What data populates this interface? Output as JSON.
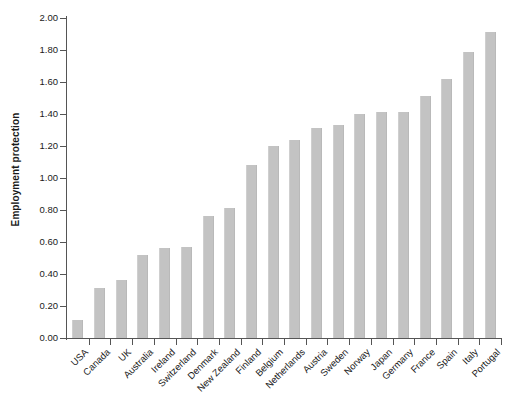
{
  "chart_data": {
    "type": "bar",
    "title": "",
    "xlabel": "",
    "ylabel": "Employment protection",
    "ylim": [
      0,
      2.0
    ],
    "ytick_step": 0.2,
    "grid": false,
    "legend": null,
    "bar_color": "#c3c3c3",
    "axis_color": "#555555",
    "categories": [
      "USA",
      "Canada",
      "UK",
      "Australia",
      "Ireland",
      "Switzerland",
      "Denmark",
      "New Zealand",
      "Finland",
      "Belgium",
      "Netherlands",
      "Austria",
      "Sweden",
      "Norway",
      "Japan",
      "Germany",
      "France",
      "Spain",
      "Italy",
      "Portugal"
    ],
    "values": [
      0.11,
      0.31,
      0.36,
      0.52,
      0.56,
      0.57,
      0.76,
      0.81,
      1.08,
      1.2,
      1.24,
      1.31,
      1.33,
      1.4,
      1.41,
      1.41,
      1.51,
      1.62,
      1.79,
      1.91
    ],
    "ytick_labels": [
      "0.00",
      "0.20",
      "0.40",
      "0.60",
      "0.80",
      "1.00",
      "1.20",
      "1.40",
      "1.60",
      "1.80",
      "2.00"
    ],
    "ytick_values": [
      0.0,
      0.2,
      0.4,
      0.6,
      0.8,
      1.0,
      1.2,
      1.4,
      1.6,
      1.8,
      2.0
    ]
  }
}
